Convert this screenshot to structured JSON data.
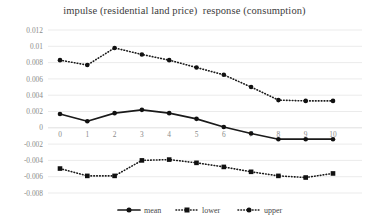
{
  "chart_data": {
    "type": "line",
    "title": "impulse (residential land price)  response (consumption)",
    "xlabel": "",
    "ylabel": "",
    "x": [
      0,
      1,
      2,
      3,
      4,
      5,
      6,
      7,
      8,
      9,
      10
    ],
    "xtick_labels": [
      "0",
      "1",
      "2",
      "3",
      "4",
      "5",
      "6",
      "7",
      "8",
      "9",
      "10"
    ],
    "ytick_labels": [
      "0.012",
      "0.01",
      "0.008",
      "0.006",
      "0.004",
      "0.002",
      "0",
      "-0.002",
      "-0.004",
      "-0.006",
      "-0.008"
    ],
    "ytick_values": [
      0.012,
      0.01,
      0.008,
      0.006,
      0.004,
      0.002,
      0,
      -0.002,
      -0.004,
      -0.006,
      -0.008
    ],
    "ylim": [
      -0.008,
      0.012
    ],
    "xlim": [
      0,
      10
    ],
    "grid": true,
    "legend_position": "bottom",
    "series": [
      {
        "name": "mean",
        "style": "solid",
        "marker": "circle",
        "color": "#111111",
        "values": [
          0.0017,
          0.0008,
          0.0018,
          0.0022,
          0.0018,
          0.0011,
          0.0001,
          -0.0007,
          -0.0014,
          -0.0014,
          -0.0014
        ]
      },
      {
        "name": "lower",
        "style": "dotted",
        "marker": "square",
        "color": "#111111",
        "values": [
          -0.005,
          -0.0059,
          -0.0059,
          -0.004,
          -0.0039,
          -0.0043,
          -0.0048,
          -0.0054,
          -0.0059,
          -0.0061,
          -0.0056
        ]
      },
      {
        "name": "upper",
        "style": "dotted",
        "marker": "circle",
        "color": "#111111",
        "values": [
          0.0083,
          0.0077,
          0.0098,
          0.009,
          0.0083,
          0.0074,
          0.0065,
          0.005,
          0.0034,
          0.0033,
          0.0033
        ]
      }
    ]
  },
  "legend": {
    "items": [
      {
        "label": "mean"
      },
      {
        "label": "lower"
      },
      {
        "label": "upper"
      }
    ]
  }
}
